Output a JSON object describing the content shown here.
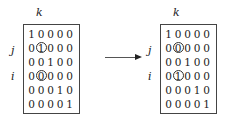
{
  "diagram": {
    "left": {
      "col_label": "k",
      "row_labels": {
        "j": "j",
        "i": "i"
      },
      "matrix": [
        [
          "1",
          "0",
          "0",
          "0",
          "0"
        ],
        [
          "0",
          "1",
          "0",
          "0",
          "0"
        ],
        [
          "0",
          "0",
          "1",
          "0",
          "0"
        ],
        [
          "0",
          "0",
          "0",
          "0",
          "0"
        ],
        [
          "0",
          "0",
          "0",
          "1",
          "0"
        ],
        [
          "0",
          "0",
          "0",
          "0",
          "1"
        ]
      ],
      "circled": [
        [
          1,
          1
        ],
        [
          3,
          1
        ]
      ]
    },
    "right": {
      "col_label": "k",
      "row_labels": {
        "j": "j",
        "i": "i"
      },
      "matrix": [
        [
          "1",
          "0",
          "0",
          "0",
          "0"
        ],
        [
          "0",
          "0",
          "0",
          "0",
          "0"
        ],
        [
          "0",
          "0",
          "1",
          "0",
          "0"
        ],
        [
          "0",
          "1",
          "0",
          "0",
          "0"
        ],
        [
          "0",
          "0",
          "0",
          "1",
          "0"
        ],
        [
          "0",
          "0",
          "0",
          "0",
          "1"
        ]
      ],
      "circled": [
        [
          1,
          1
        ],
        [
          3,
          1
        ]
      ]
    },
    "arrow": "right-arrow"
  }
}
